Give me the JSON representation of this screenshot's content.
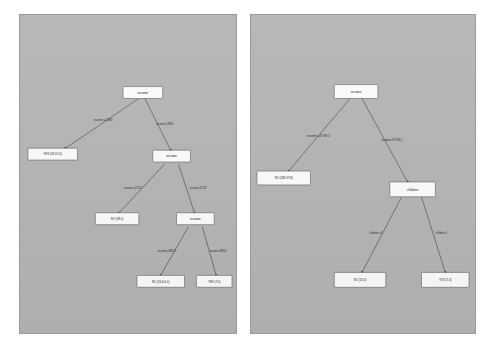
{
  "canvas": {
    "background": "#ffffff",
    "panel_background": "#b4b4b4",
    "panel_border": "#9a9a9a",
    "node_fill": "#fbfbfb",
    "node_border": "#6d6d6d",
    "edge_color": "#3a3a3a",
    "text_color": "#1a1a1a"
  },
  "left_panel": {
    "title": "",
    "tree": {
      "root": {
        "label": "income"
      },
      "nodes": [
        {
          "id": "n0",
          "label": "income",
          "type": "split"
        },
        {
          "id": "n1",
          "label": "YES (29.0/2.0)",
          "type": "leaf"
        },
        {
          "id": "n2",
          "label": "income",
          "type": "split"
        },
        {
          "id": "n3",
          "label": "NO (38.0)",
          "type": "leaf"
        },
        {
          "id": "n4",
          "label": "income",
          "type": "split"
        },
        {
          "id": "n5",
          "label": "NO (26.0/1.0)",
          "type": "leaf"
        },
        {
          "id": "n6",
          "label": "YES (7.0)",
          "type": "leaf"
        }
      ],
      "edges": [
        {
          "from": "n0",
          "to": "n1",
          "label": "income<=12880"
        },
        {
          "from": "n0",
          "to": "n2",
          "label": "income>12880"
        },
        {
          "from": "n2",
          "to": "n3",
          "label": "income<=27252"
        },
        {
          "from": "n2",
          "to": "n4",
          "label": "income>27252"
        },
        {
          "from": "n4",
          "to": "n5",
          "label": "income<=38812"
        },
        {
          "from": "n4",
          "to": "n6",
          "label": "income>38812"
        }
      ]
    }
  },
  "right_panel": {
    "title": "",
    "tree": {
      "root": {
        "label": "income"
      },
      "nodes": [
        {
          "id": "m0",
          "label": "income",
          "type": "split"
        },
        {
          "id": "m1",
          "label": "NO (288.97/0)",
          "type": "leaf"
        },
        {
          "id": "m2",
          "label": "children",
          "type": "split"
        },
        {
          "id": "m3",
          "label": "NO (13.0)",
          "type": "leaf"
        },
        {
          "id": "m4",
          "label": "YES (7.0)",
          "type": "leaf"
        }
      ],
      "edges": [
        {
          "from": "m0",
          "to": "m1",
          "label": "income<=47799.5"
        },
        {
          "from": "m0",
          "to": "m2",
          "label": "income>47799.5"
        },
        {
          "from": "m2",
          "to": "m3",
          "label": "children<=1"
        },
        {
          "from": "m2",
          "to": "m4",
          "label": "children>1"
        }
      ]
    }
  }
}
